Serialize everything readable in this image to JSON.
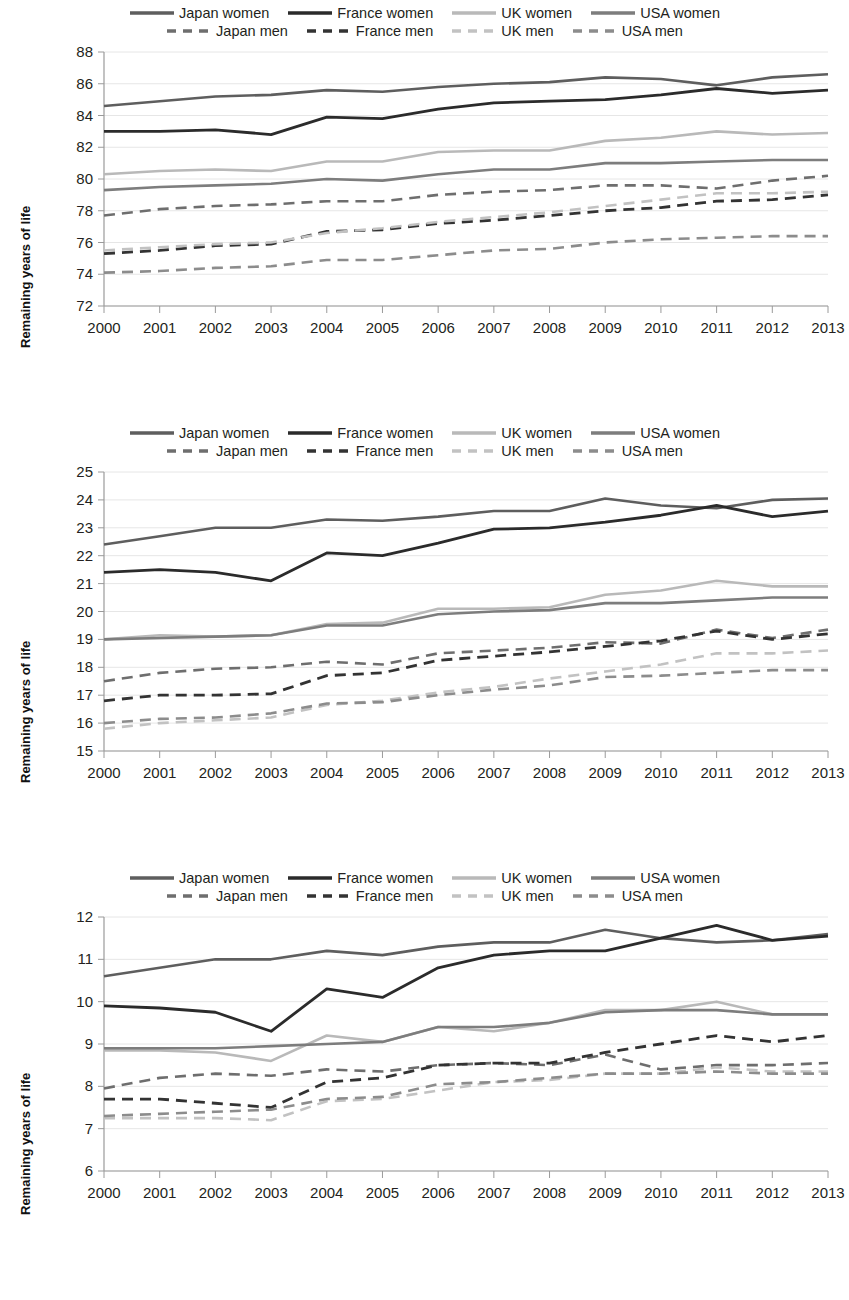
{
  "series_meta": [
    {
      "key": "japan_women",
      "label": "Japan women",
      "color": "#5e5e5e",
      "dash": false,
      "width": 2.6
    },
    {
      "key": "france_women",
      "label": "France women",
      "color": "#2b2b2b",
      "dash": false,
      "width": 2.8
    },
    {
      "key": "uk_women",
      "label": "UK women",
      "color": "#b9b9b9",
      "dash": false,
      "width": 2.6
    },
    {
      "key": "usa_women",
      "label": "USA women",
      "color": "#7d7d7d",
      "dash": false,
      "width": 2.6
    },
    {
      "key": "japan_men",
      "label": "Japan men",
      "color": "#6e6e6e",
      "dash": true,
      "width": 2.6
    },
    {
      "key": "france_men",
      "label": "France men",
      "color": "#333333",
      "dash": true,
      "width": 2.8
    },
    {
      "key": "uk_men",
      "label": "UK men",
      "color": "#c2c2c2",
      "dash": true,
      "width": 2.6
    },
    {
      "key": "usa_men",
      "label": "USA men",
      "color": "#8c8c8c",
      "dash": true,
      "width": 2.6
    }
  ],
  "legend": {
    "row1": [
      "Japan women",
      "France women",
      "UK women",
      "USA women"
    ],
    "row2": [
      "Japan men",
      "France men",
      "UK men",
      "USA men"
    ]
  },
  "axis_title_y": "Remaining years of life",
  "chart_data": [
    {
      "id": "chart-at-birth",
      "type": "line",
      "title": "",
      "xlabel": "",
      "ylabel": "Remaining years of life",
      "x": [
        "2000",
        "2001",
        "2002",
        "2003",
        "2004",
        "2005",
        "2006",
        "2007",
        "2008",
        "2009",
        "2010",
        "2011",
        "2012",
        "2013"
      ],
      "ylim": [
        72,
        88
      ],
      "ystep": 2,
      "yticks": [
        72,
        74,
        76,
        78,
        80,
        82,
        84,
        86,
        88
      ],
      "grid": true,
      "legend_position": "top",
      "series": [
        {
          "name": "Japan women",
          "key": "japan_women",
          "values": [
            84.6,
            84.9,
            85.2,
            85.3,
            85.6,
            85.5,
            85.8,
            86.0,
            86.1,
            86.4,
            86.3,
            85.9,
            86.4,
            86.6
          ]
        },
        {
          "name": "France women",
          "key": "france_women",
          "values": [
            83.0,
            83.0,
            83.1,
            82.8,
            83.9,
            83.8,
            84.4,
            84.8,
            84.9,
            85.0,
            85.3,
            85.7,
            85.4,
            85.6
          ]
        },
        {
          "name": "UK women",
          "key": "uk_women",
          "values": [
            80.3,
            80.5,
            80.6,
            80.5,
            81.1,
            81.1,
            81.7,
            81.8,
            81.8,
            82.4,
            82.6,
            83.0,
            82.8,
            82.9
          ]
        },
        {
          "name": "USA women",
          "key": "usa_women",
          "values": [
            79.3,
            79.5,
            79.6,
            79.7,
            80.0,
            79.9,
            80.3,
            80.6,
            80.6,
            81.0,
            81.0,
            81.1,
            81.2,
            81.2
          ]
        },
        {
          "name": "Japan men",
          "key": "japan_men",
          "values": [
            77.7,
            78.1,
            78.3,
            78.4,
            78.6,
            78.6,
            79.0,
            79.2,
            79.3,
            79.6,
            79.6,
            79.4,
            79.9,
            80.2
          ]
        },
        {
          "name": "France men",
          "key": "france_men",
          "values": [
            75.3,
            75.5,
            75.8,
            75.9,
            76.7,
            76.8,
            77.2,
            77.4,
            77.7,
            78.0,
            78.2,
            78.6,
            78.7,
            79.0
          ]
        },
        {
          "name": "UK men",
          "key": "uk_men",
          "values": [
            75.5,
            75.7,
            75.9,
            76.0,
            76.6,
            76.9,
            77.3,
            77.6,
            77.9,
            78.3,
            78.7,
            79.1,
            79.1,
            79.2
          ]
        },
        {
          "name": "USA men",
          "key": "usa_men",
          "values": [
            74.1,
            74.2,
            74.4,
            74.5,
            74.9,
            74.9,
            75.2,
            75.5,
            75.6,
            76.0,
            76.2,
            76.3,
            76.4,
            76.4
          ]
        }
      ]
    },
    {
      "id": "chart-at-65",
      "type": "line",
      "title": "",
      "xlabel": "",
      "ylabel": "Remaining years of life",
      "x": [
        "2000",
        "2001",
        "2002",
        "2003",
        "2004",
        "2005",
        "2006",
        "2007",
        "2008",
        "2009",
        "2010",
        "2011",
        "2012",
        "2013"
      ],
      "ylim": [
        15,
        25
      ],
      "ystep": 1,
      "yticks": [
        15,
        16,
        17,
        18,
        19,
        20,
        21,
        22,
        23,
        24,
        25
      ],
      "grid": true,
      "legend_position": "top",
      "series": [
        {
          "name": "Japan women",
          "key": "japan_women",
          "values": [
            22.4,
            22.7,
            23.0,
            23.0,
            23.3,
            23.25,
            23.4,
            23.6,
            23.6,
            24.05,
            23.8,
            23.7,
            24.0,
            24.05
          ]
        },
        {
          "name": "France women",
          "key": "france_women",
          "values": [
            21.4,
            21.5,
            21.4,
            21.1,
            22.1,
            22.0,
            22.45,
            22.95,
            23.0,
            23.2,
            23.45,
            23.8,
            23.4,
            23.6
          ]
        },
        {
          "name": "UK women",
          "key": "uk_women",
          "values": [
            19.0,
            19.15,
            19.1,
            19.15,
            19.55,
            19.6,
            20.1,
            20.1,
            20.15,
            20.6,
            20.75,
            21.1,
            20.9,
            20.9
          ]
        },
        {
          "name": "USA women",
          "key": "usa_women",
          "values": [
            19.0,
            19.05,
            19.1,
            19.15,
            19.5,
            19.5,
            19.9,
            20.0,
            20.05,
            20.3,
            20.3,
            20.4,
            20.5,
            20.5
          ]
        },
        {
          "name": "Japan men",
          "key": "japan_men",
          "values": [
            17.5,
            17.8,
            17.95,
            18.0,
            18.2,
            18.1,
            18.5,
            18.6,
            18.7,
            18.9,
            18.85,
            19.35,
            19.05,
            19.35
          ]
        },
        {
          "name": "France men",
          "key": "france_men",
          "values": [
            16.8,
            17.0,
            17.0,
            17.05,
            17.7,
            17.8,
            18.25,
            18.4,
            18.55,
            18.75,
            18.95,
            19.3,
            19.0,
            19.2
          ]
        },
        {
          "name": "UK men",
          "key": "uk_men",
          "values": [
            15.8,
            16.0,
            16.1,
            16.2,
            16.65,
            16.8,
            17.1,
            17.3,
            17.6,
            17.85,
            18.1,
            18.5,
            18.5,
            18.6
          ]
        },
        {
          "name": "USA men",
          "key": "usa_men",
          "values": [
            16.0,
            16.15,
            16.2,
            16.35,
            16.7,
            16.75,
            17.0,
            17.2,
            17.35,
            17.65,
            17.7,
            17.8,
            17.9,
            17.9
          ]
        }
      ]
    },
    {
      "id": "chart-at-80",
      "type": "line",
      "title": "",
      "xlabel": "",
      "ylabel": "Remaining years of life",
      "x": [
        "2000",
        "2001",
        "2002",
        "2003",
        "2004",
        "2005",
        "2006",
        "2007",
        "2008",
        "2009",
        "2010",
        "2011",
        "2012",
        "2013"
      ],
      "ylim": [
        6,
        12
      ],
      "ystep": 1,
      "yticks": [
        6,
        7,
        8,
        9,
        10,
        11,
        12
      ],
      "grid": true,
      "legend_position": "top",
      "series": [
        {
          "name": "Japan women",
          "key": "japan_women",
          "values": [
            10.6,
            10.8,
            11.0,
            11.0,
            11.2,
            11.1,
            11.3,
            11.4,
            11.4,
            11.7,
            11.5,
            11.4,
            11.45,
            11.6
          ]
        },
        {
          "name": "France women",
          "key": "france_women",
          "values": [
            9.9,
            9.85,
            9.75,
            9.3,
            10.3,
            10.1,
            10.8,
            11.1,
            11.2,
            11.2,
            11.5,
            11.8,
            11.45,
            11.55
          ]
        },
        {
          "name": "UK women",
          "key": "uk_women",
          "values": [
            8.85,
            8.85,
            8.8,
            8.6,
            9.2,
            9.05,
            9.4,
            9.3,
            9.5,
            9.8,
            9.8,
            10.0,
            9.7,
            9.7
          ]
        },
        {
          "name": "USA women",
          "key": "usa_women",
          "values": [
            8.9,
            8.9,
            8.9,
            8.95,
            9.0,
            9.05,
            9.4,
            9.4,
            9.5,
            9.75,
            9.8,
            9.8,
            9.7,
            9.7
          ]
        },
        {
          "name": "Japan men",
          "key": "japan_men",
          "values": [
            7.95,
            8.2,
            8.3,
            8.25,
            8.4,
            8.35,
            8.5,
            8.55,
            8.5,
            8.75,
            8.4,
            8.5,
            8.5,
            8.55
          ]
        },
        {
          "name": "France men",
          "key": "france_men",
          "values": [
            7.7,
            7.7,
            7.6,
            7.5,
            8.1,
            8.2,
            8.5,
            8.55,
            8.55,
            8.8,
            9.0,
            9.2,
            9.05,
            9.2
          ]
        },
        {
          "name": "UK men",
          "key": "uk_men",
          "values": [
            7.25,
            7.25,
            7.25,
            7.2,
            7.65,
            7.7,
            7.9,
            8.1,
            8.15,
            8.3,
            8.3,
            8.45,
            8.35,
            8.35
          ]
        },
        {
          "name": "USA men",
          "key": "usa_men",
          "values": [
            7.3,
            7.35,
            7.4,
            7.45,
            7.7,
            7.75,
            8.05,
            8.1,
            8.2,
            8.3,
            8.3,
            8.35,
            8.3,
            8.3
          ]
        }
      ]
    }
  ]
}
